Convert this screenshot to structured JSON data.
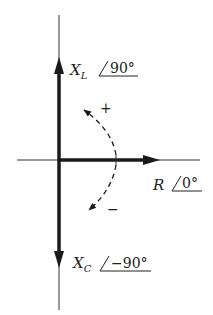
{
  "diagram": {
    "type": "phasor-diagram",
    "colors": {
      "ink": "#1a1a1a",
      "background": "#ffffff"
    },
    "phasors": [
      {
        "id": "xl",
        "symbol": "X",
        "subscript": "L",
        "angle": "90°",
        "direction": "up"
      },
      {
        "id": "r",
        "symbol": "R",
        "subscript": "",
        "angle": "0°",
        "direction": "right"
      },
      {
        "id": "xc",
        "symbol": "X",
        "subscript": "C",
        "angle": "−90°",
        "direction": "down"
      }
    ],
    "rotation_markers": {
      "positive": "+",
      "negative": "−"
    }
  }
}
